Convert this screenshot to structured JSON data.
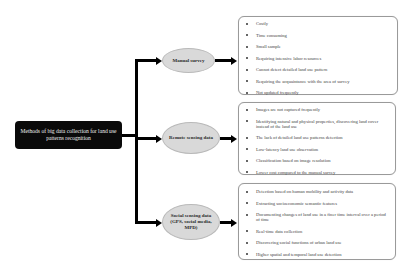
{
  "root": {
    "label": "Methods of big data collection for land use patterns recognition"
  },
  "methods": [
    {
      "label": "Manual survey",
      "items": [
        "Costly",
        "Time consuming",
        "Small sample",
        "Requiring intensive labor resources",
        "Cannot detect detailed land use pattern",
        "Requiring the acquaintance with the area of survey",
        "Not updated frequently"
      ]
    },
    {
      "label": "Remote sensing data",
      "items": [
        "Images are not captured frequently",
        "Identifying natural and physical properties, discovering land cover instead of the land use",
        "The lack of detailed land use patterns detection",
        "Low-latency land use observation",
        "Classification based on image resolution",
        "Lower cost compared to the manual survey"
      ]
    },
    {
      "label": "Social sensing data (GPS, social media, MPD)",
      "items": [
        "Detection based on human mobility and activity data",
        "Extracting socioeconomic semantic features",
        "Documenting changes of land use in a finer time interval over a period of time",
        "Real-time data collection",
        "Discovering social functions of urban land use",
        "Higher spatial and temporal land use detection"
      ]
    }
  ],
  "colors": {
    "root_fill": "#0a0a0a",
    "ellipse_fill": "#d9d9d9",
    "connector": "#000000",
    "box_border": "#9a9a9a"
  }
}
